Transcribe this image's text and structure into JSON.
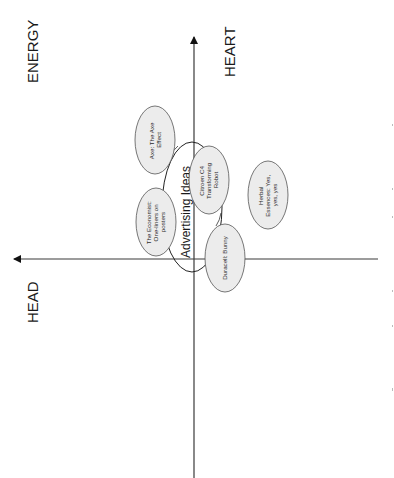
{
  "diagram": {
    "orientation": "rotated-90-ccw",
    "axes": {
      "vertical_top_label": "HEART",
      "vertical_axis_label_far": "ENERGY",
      "horizontal_left_label": "HEAD"
    },
    "labels": {
      "energy": "ENERGY",
      "heart": "HEART",
      "head": "HEAD"
    },
    "group": {
      "label": "Advertising Ideas"
    },
    "bubbles": [
      {
        "id": "axe",
        "lines": [
          "Axe: The Axe",
          "Effect"
        ]
      },
      {
        "id": "economist",
        "lines": [
          "The Economist:",
          "One-liners on",
          "posters"
        ]
      },
      {
        "id": "citroen",
        "lines": [
          "Citroen C4",
          "Transforming",
          "Robot"
        ]
      },
      {
        "id": "duracell",
        "lines": [
          "Duracell: Bunny"
        ]
      },
      {
        "id": "herbal",
        "lines": [
          "Herbal",
          "Essences: Yes,",
          "yes, yes"
        ]
      }
    ],
    "colors": {
      "bubble_fill": "#ececec",
      "bubble_stroke": "#555555",
      "axis": "#3a3a3a",
      "text": "#1a1a1a"
    }
  }
}
